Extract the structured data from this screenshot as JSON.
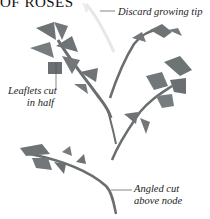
{
  "title": "OF ROSES",
  "callouts": [
    {
      "line1": "Discard growing tip"
    },
    {
      "line1": "Leaflets cut",
      "line2": "in half"
    },
    {
      "line1": "Angled cut",
      "line2": "above node"
    }
  ],
  "colors": {
    "leaf": "#6e7375",
    "stem": "#6a6e70",
    "tip": "#d9dcd9",
    "callout_line": "#555555"
  }
}
